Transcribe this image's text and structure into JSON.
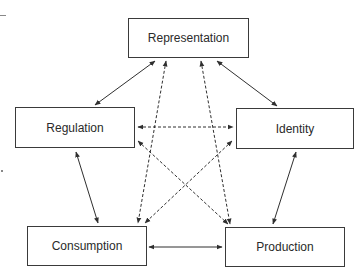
{
  "diagram": {
    "type": "relationship-cycle",
    "nodes": [
      {
        "id": "representation",
        "label": "Representation",
        "x": 128,
        "y": 18,
        "w": 121,
        "h": 40
      },
      {
        "id": "regulation",
        "label": "Regulation",
        "x": 15,
        "y": 107,
        "w": 120,
        "h": 41
      },
      {
        "id": "identity",
        "label": "Identity",
        "x": 236,
        "y": 108,
        "w": 118,
        "h": 41
      },
      {
        "id": "consumption",
        "label": "Consumption",
        "x": 27,
        "y": 226,
        "w": 120,
        "h": 40
      },
      {
        "id": "production",
        "label": "Production",
        "x": 225,
        "y": 227,
        "w": 120,
        "h": 40
      }
    ],
    "edges": [
      {
        "from": "representation",
        "to": "regulation",
        "style": "solid",
        "bidirectional": true,
        "x1": 155,
        "y1": 61,
        "x2": 95,
        "y2": 105
      },
      {
        "from": "representation",
        "to": "identity",
        "style": "solid",
        "bidirectional": true,
        "x1": 217,
        "y1": 61,
        "x2": 277,
        "y2": 106
      },
      {
        "from": "regulation",
        "to": "identity",
        "style": "dashed",
        "bidirectional": true,
        "x1": 138,
        "y1": 127,
        "x2": 233,
        "y2": 127
      },
      {
        "from": "regulation",
        "to": "consumption",
        "style": "solid",
        "bidirectional": true,
        "x1": 76,
        "y1": 152,
        "x2": 98,
        "y2": 223
      },
      {
        "from": "identity",
        "to": "production",
        "style": "solid",
        "bidirectional": true,
        "x1": 296,
        "y1": 152,
        "x2": 273,
        "y2": 224
      },
      {
        "from": "consumption",
        "to": "production",
        "style": "solid",
        "bidirectional": true,
        "x1": 149,
        "y1": 247,
        "x2": 222,
        "y2": 247
      },
      {
        "from": "representation",
        "to": "consumption",
        "style": "dashed",
        "bidirectional": true,
        "x1": 166,
        "y1": 61,
        "x2": 138,
        "y2": 223
      },
      {
        "from": "representation",
        "to": "production",
        "style": "dashed",
        "bidirectional": true,
        "x1": 201,
        "y1": 61,
        "x2": 230,
        "y2": 224
      },
      {
        "from": "regulation",
        "to": "production",
        "style": "dashed",
        "bidirectional": true,
        "x1": 138,
        "y1": 141,
        "x2": 228,
        "y2": 224
      },
      {
        "from": "identity",
        "to": "consumption",
        "style": "dashed",
        "bidirectional": true,
        "x1": 232,
        "y1": 141,
        "x2": 145,
        "y2": 223
      }
    ],
    "colors": {
      "line": "#2f2f2f",
      "border": "#3a3a3a",
      "text": "#2a2a2a",
      "background": "#ffffff"
    }
  }
}
